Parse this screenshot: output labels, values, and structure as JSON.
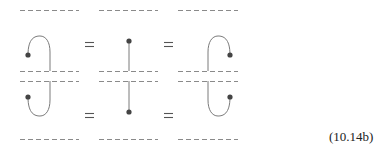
{
  "equation_label": "(10.14b)",
  "colors": {
    "dash": "#8a8a8a",
    "strand": "#7a7a7a",
    "dot": "#444444",
    "equals": "#555555"
  },
  "rows": [
    {
      "name": "top-row",
      "terms": [
        "cup-with-dot-left",
        "straight-strand-dot-top",
        "cup-with-dot-right"
      ],
      "operators": [
        "=",
        "="
      ]
    },
    {
      "name": "bottom-row",
      "terms": [
        "cap-with-dot-left",
        "straight-strand-dot-bottom",
        "cap-with-dot-right"
      ],
      "operators": [
        "=",
        "="
      ]
    }
  ]
}
